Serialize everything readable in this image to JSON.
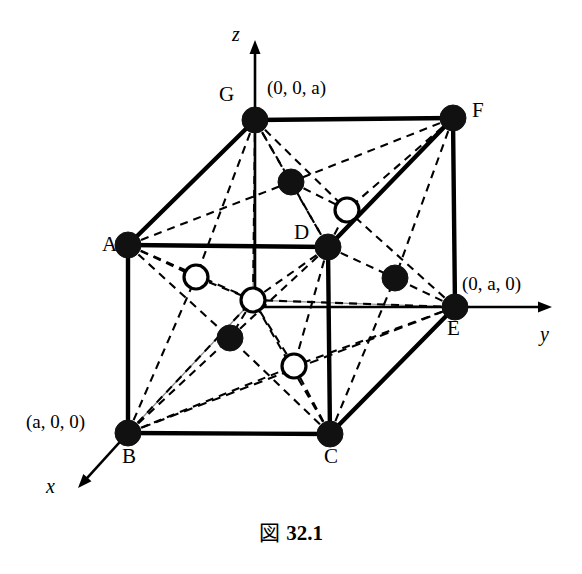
{
  "figure": {
    "caption_symbol": "図",
    "caption_number": "32.1",
    "colors": {
      "ink": "#000000",
      "background": "#ffffff",
      "axis_thin": "#8a8a8a",
      "filled_atom": "#111111",
      "open_atom_fill": "#ffffff"
    }
  },
  "axes": [
    {
      "name": "z",
      "label": "z",
      "label_x": 232,
      "label_y": 24,
      "from": [
        255,
        299
      ],
      "to": [
        255,
        40
      ]
    },
    {
      "name": "y",
      "label": "y",
      "label_x": 540,
      "label_y": 324,
      "from": [
        255,
        307
      ],
      "to": [
        552,
        307
      ]
    },
    {
      "name": "x",
      "label": "x",
      "label_x": 46,
      "label_y": 476,
      "from": [
        128,
        433
      ],
      "to": [
        78,
        488
      ]
    }
  ],
  "coordinate_labels": [
    {
      "name": "z-intercept",
      "text": "(0, 0, a)",
      "x": 267,
      "y": 78
    },
    {
      "name": "y-intercept",
      "text": "(0, a, 0)",
      "x": 462,
      "y": 274
    },
    {
      "name": "x-intercept",
      "text": "(a, 0, 0)",
      "x": 26,
      "y": 412
    }
  ],
  "vertices": [
    {
      "id": "A",
      "label": "A",
      "x": 128,
      "y": 245,
      "label_x": 102,
      "label_y": 234,
      "type": "filled"
    },
    {
      "id": "B",
      "label": "B",
      "x": 128,
      "y": 433,
      "label_x": 122,
      "label_y": 446,
      "type": "filled"
    },
    {
      "id": "C",
      "label": "C",
      "x": 330,
      "y": 434,
      "label_x": 324,
      "label_y": 446,
      "type": "filled"
    },
    {
      "id": "D",
      "label": "D",
      "x": 328,
      "y": 247,
      "label_x": 294,
      "label_y": 222,
      "type": "filled"
    },
    {
      "id": "E",
      "label": "E",
      "x": 455,
      "y": 307,
      "label_x": 447,
      "label_y": 318,
      "type": "filled"
    },
    {
      "id": "F",
      "label": "F",
      "x": 453,
      "y": 118,
      "label_x": 472,
      "label_y": 100,
      "type": "filled"
    },
    {
      "id": "G",
      "label": "G",
      "x": 255,
      "y": 120,
      "label_x": 219,
      "label_y": 84,
      "type": "filled"
    }
  ],
  "interior_atoms": [
    {
      "id": "i1",
      "type": "filled",
      "x": 291,
      "y": 182
    },
    {
      "id": "i2",
      "type": "open",
      "x": 347,
      "y": 210
    },
    {
      "id": "i3",
      "type": "open",
      "x": 196,
      "y": 277
    },
    {
      "id": "i4",
      "type": "open",
      "x": 253,
      "y": 300
    },
    {
      "id": "i5",
      "type": "filled",
      "x": 395,
      "y": 278
    },
    {
      "id": "i6",
      "type": "filled",
      "x": 230,
      "y": 338
    },
    {
      "id": "i7",
      "type": "open",
      "x": 294,
      "y": 366
    }
  ],
  "solid_edges": [
    {
      "from": "G",
      "to": "F"
    },
    {
      "from": "G",
      "to": "A"
    },
    {
      "from": "A",
      "to": "D"
    },
    {
      "from": "A",
      "to": "B"
    },
    {
      "from": "B",
      "to": "C"
    },
    {
      "from": "C",
      "to": "D"
    },
    {
      "from": "C",
      "to": "E"
    },
    {
      "from": "D",
      "to": "F"
    },
    {
      "from": "E",
      "to": "F"
    }
  ],
  "dashed_edges": [
    {
      "from": "G",
      "to": "D"
    },
    {
      "from": "B",
      "to": "E"
    }
  ],
  "dashed_bonds": [
    [
      "G",
      "i1"
    ],
    [
      "G",
      "i2"
    ],
    [
      "G",
      "i3"
    ],
    [
      "G",
      "i4"
    ],
    [
      "A",
      "i1"
    ],
    [
      "A",
      "i3"
    ],
    [
      "A",
      "i4"
    ],
    [
      "A",
      "i6"
    ],
    [
      "D",
      "i1"
    ],
    [
      "D",
      "i2"
    ],
    [
      "D",
      "i4"
    ],
    [
      "D",
      "i5"
    ],
    [
      "D",
      "i6"
    ],
    [
      "D",
      "i7"
    ],
    [
      "F",
      "i1"
    ],
    [
      "F",
      "i2"
    ],
    [
      "F",
      "i5"
    ],
    [
      "E",
      "i2"
    ],
    [
      "E",
      "i5"
    ],
    [
      "E",
      "i7"
    ],
    [
      "E",
      "i4"
    ],
    [
      "B",
      "i3"
    ],
    [
      "B",
      "i4"
    ],
    [
      "B",
      "i6"
    ],
    [
      "B",
      "i7"
    ],
    [
      "C",
      "i4"
    ],
    [
      "C",
      "i6"
    ],
    [
      "C",
      "i7"
    ],
    [
      "C",
      "i5"
    ],
    [
      "i1",
      "i2"
    ],
    [
      "i3",
      "i4"
    ],
    [
      "i4",
      "i7"
    ],
    [
      "i4",
      "i6"
    ]
  ],
  "atom_radii": {
    "filled": 13,
    "open": 12,
    "vertex": 13
  }
}
